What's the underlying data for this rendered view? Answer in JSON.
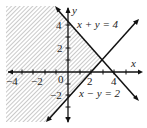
{
  "diagram": {
    "type": "linear-inequality-graph",
    "axes": {
      "x_label": "x",
      "y_label": "y",
      "origin_label": "0"
    },
    "x_ticks": [
      {
        "value": -4,
        "label": "−4"
      },
      {
        "value": -2,
        "label": "−2"
      },
      {
        "value": 2,
        "label": "2"
      },
      {
        "value": 4,
        "label": "4"
      }
    ],
    "y_ticks": [
      {
        "value": 4,
        "label": "4"
      },
      {
        "value": 2,
        "label": "2"
      },
      {
        "value": -2,
        "label": "−2"
      }
    ],
    "lines": [
      {
        "equation": "x + y = 4"
      },
      {
        "equation": "x − y = 2"
      }
    ],
    "shading": "diagonal hatching on the left-hand region bounded by the two lines"
  }
}
